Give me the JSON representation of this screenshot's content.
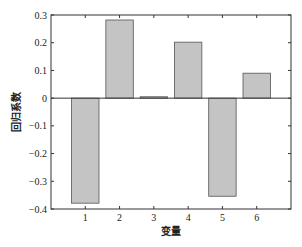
{
  "chart_data": {
    "type": "bar",
    "title": "",
    "xlabel": "变量",
    "ylabel": "回归系数",
    "categories": [
      "1",
      "2",
      "3",
      "4",
      "5",
      "6"
    ],
    "values": [
      -0.379,
      0.282,
      0.005,
      0.202,
      -0.354,
      0.09
    ],
    "ylim": [
      -0.4,
      0.3
    ],
    "yticks": [
      "0.3",
      "0.2",
      "0.1",
      "0",
      "-0.1",
      "-0.2",
      "-0.3",
      "-0.4"
    ],
    "grid": false,
    "legend": null,
    "colors": {
      "bar_fill": "#c4c4c4",
      "bar_edge": "#555555",
      "axis": "#333333"
    }
  }
}
